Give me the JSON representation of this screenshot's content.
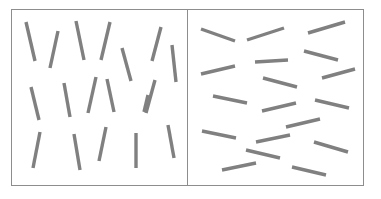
{
  "figure": {
    "title": "",
    "caption": "",
    "width": 381,
    "height": 199,
    "background_color": "#ffffff",
    "line_color": "#808080",
    "line_width": 3.4,
    "border_color": "#8d8d8d",
    "border_width": 1
  },
  "frame": {
    "outer": {
      "x": 11,
      "y": 9,
      "width": 353,
      "height": 177
    },
    "divider": {
      "x": 187,
      "y1": 9,
      "y2": 186
    }
  },
  "panels": [
    {
      "id": "left-panel",
      "name": "vertical-lines-panel",
      "label": "",
      "orientation_class": "near-vertical",
      "bounds": {
        "x": 11,
        "y": 9,
        "width": 176,
        "height": 177
      },
      "line_count": 18,
      "lines": [
        {
          "x1": 26,
          "y1": 22,
          "x2": 35,
          "y2": 61
        },
        {
          "x1": 58,
          "y1": 31,
          "x2": 50,
          "y2": 68
        },
        {
          "x1": 76,
          "y1": 21,
          "x2": 84,
          "y2": 60
        },
        {
          "x1": 110,
          "y1": 22,
          "x2": 101,
          "y2": 60
        },
        {
          "x1": 122,
          "y1": 48,
          "x2": 131,
          "y2": 81
        },
        {
          "x1": 161,
          "y1": 27,
          "x2": 152,
          "y2": 61
        },
        {
          "x1": 172,
          "y1": 45,
          "x2": 176,
          "y2": 82
        },
        {
          "x1": 31,
          "y1": 87,
          "x2": 39,
          "y2": 120
        },
        {
          "x1": 64,
          "y1": 83,
          "x2": 70,
          "y2": 117
        },
        {
          "x1": 88,
          "y1": 113,
          "x2": 96,
          "y2": 77
        },
        {
          "x1": 107,
          "y1": 79,
          "x2": 114,
          "y2": 112
        },
        {
          "x1": 155,
          "y1": 80,
          "x2": 146,
          "y2": 113
        },
        {
          "x1": 40,
          "y1": 132,
          "x2": 33,
          "y2": 168
        },
        {
          "x1": 74,
          "y1": 134,
          "x2": 80,
          "y2": 170
        },
        {
          "x1": 106,
          "y1": 127,
          "x2": 99,
          "y2": 161
        },
        {
          "x1": 136,
          "y1": 133,
          "x2": 136,
          "y2": 168
        },
        {
          "x1": 168,
          "y1": 125,
          "x2": 174,
          "y2": 158
        },
        {
          "x1": 148,
          "y1": 95,
          "x2": 144,
          "y2": 112
        }
      ]
    },
    {
      "id": "right-panel",
      "name": "horizontal-lines-panel",
      "label": "",
      "orientation_class": "near-horizontal",
      "bounds": {
        "x": 187,
        "y": 9,
        "width": 177,
        "height": 177
      },
      "line_count": 18,
      "lines": [
        {
          "x1": 201,
          "y1": 29,
          "x2": 235,
          "y2": 41
        },
        {
          "x1": 247,
          "y1": 40,
          "x2": 284,
          "y2": 28
        },
        {
          "x1": 308,
          "y1": 33,
          "x2": 345,
          "y2": 22
        },
        {
          "x1": 304,
          "y1": 51,
          "x2": 338,
          "y2": 60
        },
        {
          "x1": 255,
          "y1": 62,
          "x2": 288,
          "y2": 60
        },
        {
          "x1": 201,
          "y1": 74,
          "x2": 235,
          "y2": 66
        },
        {
          "x1": 263,
          "y1": 78,
          "x2": 297,
          "y2": 87
        },
        {
          "x1": 322,
          "y1": 78,
          "x2": 355,
          "y2": 69
        },
        {
          "x1": 213,
          "y1": 96,
          "x2": 247,
          "y2": 103
        },
        {
          "x1": 315,
          "y1": 100,
          "x2": 349,
          "y2": 108
        },
        {
          "x1": 262,
          "y1": 111,
          "x2": 296,
          "y2": 103
        },
        {
          "x1": 202,
          "y1": 131,
          "x2": 236,
          "y2": 138
        },
        {
          "x1": 286,
          "y1": 127,
          "x2": 320,
          "y2": 119
        },
        {
          "x1": 256,
          "y1": 142,
          "x2": 290,
          "y2": 135
        },
        {
          "x1": 314,
          "y1": 142,
          "x2": 348,
          "y2": 152
        },
        {
          "x1": 246,
          "y1": 150,
          "x2": 280,
          "y2": 158
        },
        {
          "x1": 222,
          "y1": 170,
          "x2": 256,
          "y2": 163
        },
        {
          "x1": 292,
          "y1": 167,
          "x2": 326,
          "y2": 175
        }
      ]
    }
  ]
}
